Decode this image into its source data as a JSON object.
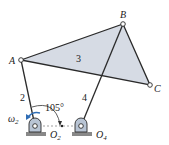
{
  "diagram": {
    "type": "linkage-mechanism",
    "colors": {
      "link": "#2a2a2a",
      "coupler_fill": "#d6dbe4",
      "omega_arrow": "#2f6db5",
      "ground_hatch": "#555555",
      "pivot_fill": "#b8c4d4"
    },
    "points": {
      "A": {
        "label": "A",
        "x": 21,
        "y": 60
      },
      "B": {
        "label": "B",
        "x": 123,
        "y": 24
      },
      "C": {
        "label": "C",
        "x": 150,
        "y": 85
      },
      "O2": {
        "label": "O",
        "sub": "2",
        "x": 35,
        "y": 126
      },
      "O4": {
        "label": "O",
        "sub": "4",
        "x": 81,
        "y": 126
      }
    },
    "links": [
      {
        "id": "2",
        "label": "2",
        "from": "O2",
        "to": "A"
      },
      {
        "id": "3",
        "label": "3",
        "vertices": [
          "A",
          "B",
          "C"
        ]
      },
      {
        "id": "4",
        "label": "4",
        "from": "O4",
        "to": "B"
      }
    ],
    "angle": {
      "value": "105°",
      "between": [
        "link 2",
        "ground line O2O4"
      ]
    },
    "angular_velocity": {
      "symbol": "ω",
      "sub": "2"
    }
  }
}
